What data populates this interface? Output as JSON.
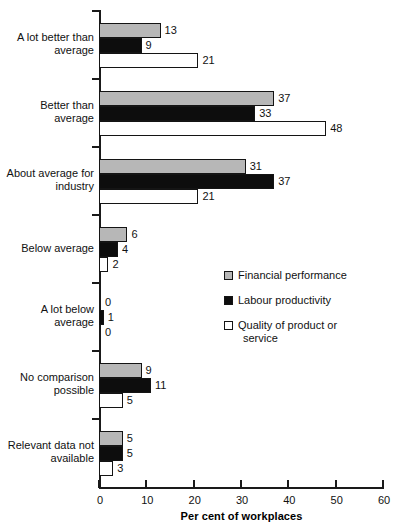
{
  "chart_data": {
    "type": "bar",
    "orientation": "horizontal",
    "title": "",
    "xlabel": "Per cent of workplaces",
    "ylabel": "",
    "xlim": [
      0,
      60
    ],
    "xticks": [
      0,
      10,
      20,
      30,
      40,
      50,
      60
    ],
    "grid": false,
    "legend_position": "center-right",
    "categories": [
      "A lot better than average",
      "Better than average",
      "About average for industry",
      "Below average",
      "A lot below average",
      "No comparison possible",
      "Relevant data not available"
    ],
    "series": [
      {
        "name": "Financial performance",
        "color": "#b7b7b7",
        "values": [
          13,
          37,
          31,
          6,
          0,
          9,
          5
        ]
      },
      {
        "name": "Labour productivity",
        "color": "#0d0d0d",
        "values": [
          9,
          33,
          37,
          4,
          1,
          11,
          5
        ]
      },
      {
        "name": "Quality of product or service",
        "color": "#ffffff",
        "values": [
          21,
          48,
          21,
          2,
          0,
          5,
          3
        ]
      }
    ]
  },
  "axis": {
    "x_title": "Per cent of workplaces",
    "tick_labels": [
      "0",
      "10",
      "20",
      "30",
      "40",
      "50",
      "60"
    ]
  },
  "categories": [
    {
      "line1": "A lot better than",
      "line2": "average"
    },
    {
      "line1": "Better than",
      "line2": "average"
    },
    {
      "line1": "About average for",
      "line2": "industry"
    },
    {
      "line1": "Below average",
      "line2": ""
    },
    {
      "line1": "A lot below",
      "line2": "average"
    },
    {
      "line1": "No comparison",
      "line2": "possible"
    },
    {
      "line1": "Relevant data not",
      "line2": "available"
    }
  ],
  "legend": {
    "items": [
      {
        "label": "Financial performance",
        "label2": "",
        "swatch": "gray-square-icon"
      },
      {
        "label": "Labour productivity",
        "label2": "",
        "swatch": "black-square-icon"
      },
      {
        "label": "Quality of product or",
        "label2": "service",
        "swatch": "white-square-icon"
      }
    ]
  },
  "values": {
    "g0": [
      "13",
      "9",
      "21"
    ],
    "g1": [
      "37",
      "33",
      "48"
    ],
    "g2": [
      "31",
      "37",
      "21"
    ],
    "g3": [
      "6",
      "4",
      "2"
    ],
    "g4": [
      "0",
      "1",
      "0"
    ],
    "g5": [
      "9",
      "11",
      "5"
    ],
    "g6": [
      "5",
      "5",
      "3"
    ]
  }
}
